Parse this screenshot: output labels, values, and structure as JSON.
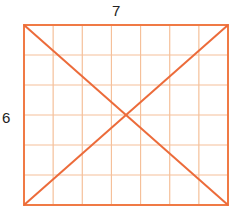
{
  "labels": {
    "width": "7",
    "height": "6"
  },
  "grid": {
    "columns": 7,
    "rows": 6
  },
  "colors": {
    "grid_line": "#f5c09a",
    "outline": "#f07a45",
    "diagonal": "#ec6b3a",
    "text": "#222222"
  }
}
